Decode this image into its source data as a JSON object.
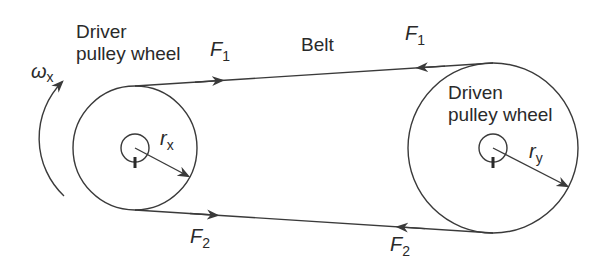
{
  "diagram": {
    "type": "belt-drive",
    "colors": {
      "line": "#3a3a3a",
      "text": "#2a2a2a",
      "background": "#ffffff"
    },
    "labels": {
      "driver_line1": "Driver",
      "driver_line2": "pulley wheel",
      "driven_line1": "Driven",
      "driven_line2": "pulley wheel",
      "belt": "Belt",
      "omega_symbol": "ω",
      "omega_sub": "x",
      "f1_top_left_main": "F",
      "f1_top_left_sub": "1",
      "f1_top_right_main": "F",
      "f1_top_right_sub": "1",
      "f2_bottom_left_main": "F",
      "f2_bottom_left_sub": "2",
      "f2_bottom_right_main": "F",
      "f2_bottom_right_sub": "2",
      "rx_main": "r",
      "rx_sub": "x",
      "ry_main": "r",
      "ry_sub": "y"
    },
    "driver_pulley": {
      "cx": 135,
      "cy": 148,
      "r": 62,
      "hub_r": 14
    },
    "driven_pulley": {
      "cx": 493,
      "cy": 148,
      "r": 85,
      "hub_r": 14
    }
  }
}
